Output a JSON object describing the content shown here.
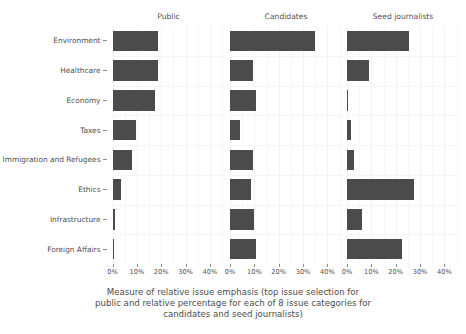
{
  "chart_data": {
    "type": "bar",
    "title": "",
    "subtitle": "",
    "xlabel": "Measure of relative issue emphasis (top issue selection for public and relative percentage for each of 8 issue categories for candidates and seed journalists)",
    "ylabel": "",
    "orientation": "horizontal",
    "grid": true,
    "legend_position": "none",
    "facet_titles": [
      "Public",
      "Candidates",
      "Seed journalists"
    ],
    "categories": [
      "Environment",
      "Healthcare",
      "Economy",
      "Taxes",
      "Immigration and Refugees",
      "Ethics",
      "Infrastructure",
      "Foreign Affairs"
    ],
    "xlim": [
      0,
      46
    ],
    "xticks": [
      0,
      10,
      20,
      30,
      40
    ],
    "xticklabels": [
      "0%",
      "10%",
      "20%",
      "30%",
      "40%"
    ],
    "series": [
      {
        "name": "Public",
        "values": [
          18.5,
          18.5,
          17.5,
          9.5,
          8.0,
          3.5,
          1.0,
          0.8
        ]
      },
      {
        "name": "Candidates",
        "values": [
          35.0,
          9.5,
          10.5,
          4.0,
          9.5,
          8.5,
          10.0,
          10.5
        ]
      },
      {
        "name": "Seed journalists",
        "values": [
          25.5,
          9.0,
          0.5,
          1.5,
          2.8,
          27.5,
          6.0,
          22.5
        ]
      }
    ],
    "bar_color": "#4b4b4b",
    "background_color": "#ffffff",
    "gridline_color": "#f2f2f2",
    "text_color": "#4f4f4f"
  },
  "caption": {
    "line1": "Measure of relative issue emphasis (top issue selection for",
    "line2": "public and relative percentage for each of 8 issue categories for",
    "line3": "candidates and seed journalists)"
  }
}
